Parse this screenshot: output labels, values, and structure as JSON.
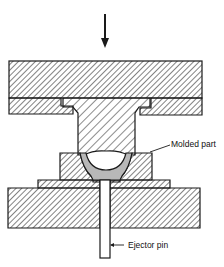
{
  "diagram": {
    "type": "compression-molding cross-section",
    "labels": {
      "molded_part": "Molded part",
      "ejector_pin": "Ejector pin"
    },
    "colors": {
      "ink": "#1a1a1a",
      "background": "#ffffff",
      "molded_part_fill": "#b8b8b8"
    },
    "elements": [
      {
        "name": "force-arrow",
        "direction": "down"
      },
      {
        "name": "upper-platen"
      },
      {
        "name": "upper-retainer-plate"
      },
      {
        "name": "punch"
      },
      {
        "name": "cavity-block"
      },
      {
        "name": "cavity-base"
      },
      {
        "name": "lower-platen"
      },
      {
        "name": "molded-part"
      },
      {
        "name": "ejector-pin"
      }
    ]
  }
}
